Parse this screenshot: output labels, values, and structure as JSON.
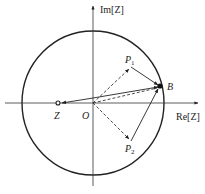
{
  "diagram": {
    "type": "complex-plane-vector-diagram",
    "axes": {
      "x_label": "Re[Z]",
      "y_label": "Im[Z]"
    },
    "points": {
      "origin": {
        "label": "O"
      },
      "z": {
        "label": "Z"
      },
      "b": {
        "label": "B"
      },
      "p1": {
        "label": "P",
        "sub": "1"
      },
      "p2": {
        "label": "P",
        "sub": "2"
      }
    },
    "colors": {
      "stroke": "#222222",
      "background": "#ffffff"
    },
    "elements": [
      {
        "kind": "circle",
        "desc": "unit circle centered at origin"
      },
      {
        "kind": "arrow-dashed",
        "from": "O",
        "to": "P1"
      },
      {
        "kind": "arrow-dashed",
        "from": "O",
        "to": "P2"
      },
      {
        "kind": "line-dashed",
        "from": "O",
        "to": "B"
      },
      {
        "kind": "arrow-solid",
        "from": "P1",
        "to": "B"
      },
      {
        "kind": "arrow-solid",
        "from": "P2",
        "to": "B"
      },
      {
        "kind": "arrow-solid",
        "from": "Z",
        "to": "B"
      },
      {
        "kind": "arrow-solid",
        "from": "O",
        "to": "Z"
      }
    ]
  }
}
